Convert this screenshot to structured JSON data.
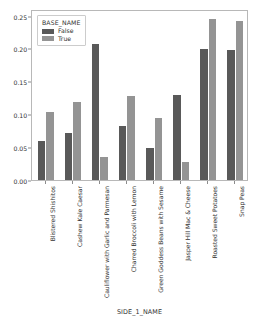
{
  "chart_data": {
    "type": "bar",
    "title": "",
    "xlabel": "SIDE_1_NAME",
    "ylabel": "",
    "ylim": [
      0.0,
      0.26
    ],
    "grid": false,
    "legend_position": "upper left",
    "legend_title": "BASE_NAME",
    "ytick_labels": [
      "0.00",
      "0.05",
      "0.10",
      "0.15",
      "0.20",
      "0.25"
    ],
    "ytick_values": [
      0.0,
      0.05,
      0.1,
      0.15,
      0.2,
      0.25
    ],
    "categories": [
      "Blistered Shishitos",
      "Cashew Kale Caesar",
      "Cauliflower with Garlic and Parmesan",
      "Charred Broccoli with Lemon",
      "Green Goddess Beans with Sesame",
      "Jasper Hill Mac & Cheese",
      "Roasted Sweet Potatoes",
      "Snap Peas"
    ],
    "series": [
      {
        "name": "False",
        "color": "#595959",
        "values": [
          0.059,
          0.071,
          0.207,
          0.082,
          0.049,
          0.13,
          0.199,
          0.198
        ]
      },
      {
        "name": "True",
        "color": "#949494",
        "values": [
          0.104,
          0.118,
          0.035,
          0.128,
          0.095,
          0.028,
          0.245,
          0.242
        ]
      }
    ]
  }
}
